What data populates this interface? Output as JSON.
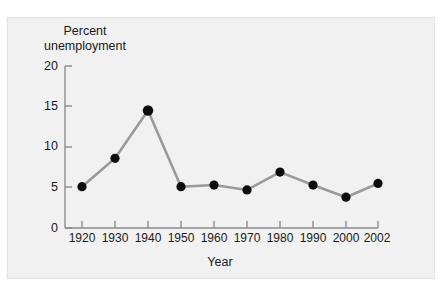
{
  "chart_data": {
    "type": "line",
    "title": "",
    "xlabel": "Year",
    "ylabel": "Percent\nunemployment",
    "ylabel_line1": "Percent",
    "ylabel_line2": "unemployment",
    "categories": [
      "1920",
      "1930",
      "1940",
      "1950",
      "1960",
      "1970",
      "1980",
      "1990",
      "2000",
      "2002"
    ],
    "x": [
      1920,
      1930,
      1940,
      1950,
      1960,
      1970,
      1980,
      1990,
      2000,
      2002
    ],
    "values": [
      5.1,
      8.6,
      14.5,
      5.1,
      5.3,
      4.7,
      6.9,
      5.3,
      3.8,
      5.5
    ],
    "series": [
      {
        "name": "Percent unemployment",
        "values": [
          5.1,
          8.6,
          14.5,
          5.1,
          5.3,
          4.7,
          6.9,
          5.3,
          3.8,
          5.5
        ]
      }
    ],
    "ylim": [
      0,
      20
    ],
    "yticks": [
      0,
      5,
      10,
      15,
      20
    ],
    "ytick_labels": [
      "0",
      "5",
      "10",
      "15",
      "20"
    ],
    "grid": false,
    "legend": false,
    "legend_position": "none",
    "marker": "filled-circle",
    "marker_color": "#0d0d0d",
    "line_color": "#9a9a9a",
    "axis_color": "#808080",
    "panel_color": "#f1f1f1",
    "text_color": "#1a1a1a"
  }
}
